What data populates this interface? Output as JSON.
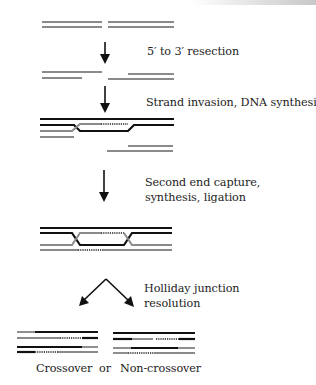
{
  "figure": {
    "colors": {
      "black_strand": "#111111",
      "grey_strand": "#8a8a8a",
      "new_synthesis": "#444444",
      "text": "#222222"
    },
    "steps": [
      {
        "id": "dsb",
        "label": ""
      },
      {
        "id": "resection",
        "label": "5′ to 3′ resection"
      },
      {
        "id": "strand-invasion",
        "label": "Strand invasion, DNA synthesis"
      },
      {
        "id": "second-end-capture",
        "label_line1": "Second end capture,",
        "label_line2": "synthesis, ligation"
      },
      {
        "id": "holliday-resolution",
        "label_line1": "Holliday junction",
        "label_line2": "resolution"
      }
    ],
    "outcomes": {
      "crossover": "Crossover",
      "or": "or",
      "noncrossover": "Non-crossover"
    },
    "icons": {
      "arrow": "down-arrow-icon",
      "split_arrow": "branching-arrow-icon"
    }
  }
}
